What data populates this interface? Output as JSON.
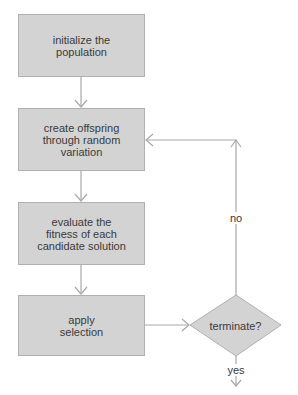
{
  "diagram": {
    "type": "flowchart",
    "title": "",
    "colors": {
      "node_fill": "#d3d3d3",
      "node_border": "#b0b0b0",
      "edge": "#a8a8a8",
      "text": "#3a3a3a",
      "background": "#ffffff"
    },
    "nodes": [
      {
        "id": "init",
        "shape": "rectangle",
        "label": "initialize the population"
      },
      {
        "id": "offspring",
        "shape": "rectangle",
        "label": "create offspring through random variation"
      },
      {
        "id": "evaluate",
        "shape": "rectangle",
        "label": "evaluate the fitness of each candidate solution"
      },
      {
        "id": "select",
        "shape": "rectangle",
        "label": "apply selection"
      },
      {
        "id": "terminate",
        "shape": "diamond",
        "label": "terminate?"
      }
    ],
    "edges": [
      {
        "from": "init",
        "to": "offspring",
        "label": ""
      },
      {
        "from": "offspring",
        "to": "evaluate",
        "label": ""
      },
      {
        "from": "evaluate",
        "to": "select",
        "label": ""
      },
      {
        "from": "select",
        "to": "terminate",
        "label": ""
      },
      {
        "from": "terminate",
        "to": "offspring",
        "label": "no"
      },
      {
        "from": "terminate",
        "to": "end",
        "label": "yes"
      }
    ]
  },
  "labels": {
    "init_line1": "initialize the",
    "init_line2": "population",
    "offspring_line1": "create offspring",
    "offspring_line2": "through random",
    "offspring_line3": "variation",
    "evaluate_line1": "evaluate the",
    "evaluate_line2": "fitness of each",
    "evaluate_line3": "candidate solution",
    "select_line1": "apply",
    "select_line2": "selection",
    "terminate": "terminate?",
    "no": "no",
    "yes": "yes"
  }
}
